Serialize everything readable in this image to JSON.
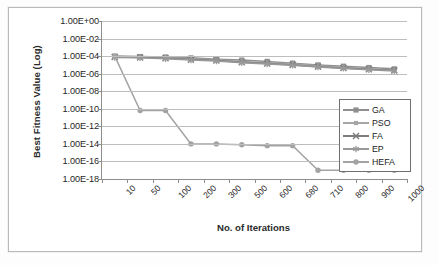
{
  "chart_data": {
    "type": "line",
    "title": "",
    "xlabel": "No. of Iterations",
    "ylabel": "Best Fitness Value (Log)",
    "log_scale": true,
    "grid": true,
    "legend_position": "inside-right",
    "categories": [
      "10",
      "50",
      "100",
      "200",
      "300",
      "500",
      "600",
      "680",
      "710",
      "800",
      "900",
      "1000"
    ],
    "ytick_labels": [
      "1.00E+00",
      "1.00E-02",
      "1.00E-04",
      "1.00E-06",
      "1.00E-08",
      "1.00E-10",
      "1.00E-12",
      "1.00E-14",
      "1.00E-16",
      "1.00E-18"
    ],
    "ytick_exponents": [
      0,
      -2,
      -4,
      -6,
      -8,
      -10,
      -12,
      -14,
      -16,
      -18
    ],
    "ylim": [
      -18,
      0
    ],
    "series": [
      {
        "name": "GA",
        "color": "#8f8f8f",
        "marker": "square",
        "exponents": [
          -4.0,
          -4.05,
          -4.1,
          -4.2,
          -4.35,
          -4.45,
          -4.6,
          -4.8,
          -5.0,
          -5.15,
          -5.3,
          -5.45
        ],
        "values": [
          0.0001,
          8.9e-05,
          7.9e-05,
          6.3e-05,
          4.5e-05,
          3.5e-05,
          2.5e-05,
          1.6e-05,
          1e-05,
          7.1e-06,
          5e-06,
          3.5e-06
        ]
      },
      {
        "name": "PSO",
        "color": "#a6a6a6",
        "marker": "small-square",
        "exponents": [
          -4.05,
          -4.1,
          -4.2,
          -4.3,
          -4.45,
          -4.6,
          -4.75,
          -4.9,
          -5.1,
          -5.3,
          -5.45,
          -5.6
        ],
        "values": [
          8.9e-05,
          7.9e-05,
          6.3e-05,
          5e-05,
          3.5e-05,
          2.5e-05,
          1.8e-05,
          1.3e-05,
          7.9e-06,
          5e-06,
          3.5e-06,
          2.5e-06
        ]
      },
      {
        "name": "FA",
        "color": "#7d7d7d",
        "marker": "cross",
        "exponents": [
          -4.1,
          -4.15,
          -4.25,
          -4.4,
          -4.5,
          -4.7,
          -4.85,
          -5.0,
          -5.2,
          -5.35,
          -5.5,
          -5.65
        ],
        "values": [
          7.9e-05,
          7.1e-05,
          5.6e-05,
          4e-05,
          3.2e-05,
          2e-05,
          1.4e-05,
          1e-05,
          6.3e-06,
          4.5e-06,
          3.2e-06,
          2.2e-06
        ]
      },
      {
        "name": "EP",
        "color": "#999999",
        "marker": "asterisk",
        "exponents": [
          -4.15,
          -4.2,
          -4.3,
          -4.45,
          -4.55,
          -4.75,
          -4.9,
          -5.05,
          -5.25,
          -5.4,
          -5.55,
          -5.7
        ],
        "values": [
          7.1e-05,
          6.3e-05,
          5e-05,
          3.5e-05,
          2.8e-05,
          1.8e-05,
          1.3e-05,
          8.9e-06,
          5.6e-06,
          4e-06,
          2.8e-06,
          2e-06
        ]
      },
      {
        "name": "HEFA",
        "color": "#a3a3a3",
        "marker": "circle",
        "exponents": [
          -4.0,
          -10.2,
          -10.2,
          -14.0,
          -14.0,
          -14.1,
          -14.2,
          -14.2,
          -17.0,
          -17.0,
          -17.0,
          -17.0
        ],
        "values": [
          0.0001,
          6.3e-11,
          6.3e-11,
          1e-14,
          1e-14,
          7.9e-15,
          6.3e-15,
          6.3e-15,
          1e-17,
          1e-17,
          1e-17,
          1e-17
        ]
      }
    ]
  },
  "legend": {
    "items": [
      {
        "label": "GA"
      },
      {
        "label": "PSO"
      },
      {
        "label": "FA"
      },
      {
        "label": "EP"
      },
      {
        "label": "HEFA"
      }
    ]
  }
}
